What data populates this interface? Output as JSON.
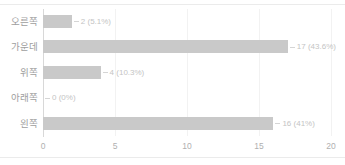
{
  "chart_data": {
    "type": "bar",
    "orientation": "horizontal",
    "title": "",
    "xlabel": "",
    "ylabel": "",
    "xlim": [
      0,
      20
    ],
    "xticks": [
      "0",
      "5",
      "10",
      "15",
      "20"
    ],
    "grid": true,
    "legend": "none",
    "bar_color": "#c9c9c9",
    "label_color": "#9e9e9e",
    "value_label_color": "#c4c4c4",
    "grid_color": "#f2f2f2",
    "axis_color": "#d8d8d8",
    "frame_color": "#ebebeb",
    "categories": [
      "오른쪽",
      "가운데",
      "위쪽",
      "아래쪽",
      "왼쪽"
    ],
    "values": [
      2,
      17,
      4,
      0,
      16
    ],
    "percents": [
      "5.1%",
      "43.6%",
      "10.3%",
      "0%",
      "41%"
    ],
    "data_labels": [
      "2 (5.1%)",
      "17 (43.6%)",
      "4 (10.3%)",
      "0 (0%)",
      "16 (41%)"
    ],
    "rows": [
      {
        "category": "오른쪽",
        "value": 2,
        "percent": "5.1%",
        "label": "2 (5.1%)"
      },
      {
        "category": "가운데",
        "value": 17,
        "percent": "43.6%",
        "label": "17 (43.6%)"
      },
      {
        "category": "위쪽",
        "value": 4,
        "percent": "10.3%",
        "label": "4 (10.3%)"
      },
      {
        "category": "아래쪽",
        "value": 0,
        "percent": "0%",
        "label": "0 (0%)"
      },
      {
        "category": "왼쪽",
        "value": 16,
        "percent": "41%",
        "label": "16 (41%)"
      }
    ]
  }
}
